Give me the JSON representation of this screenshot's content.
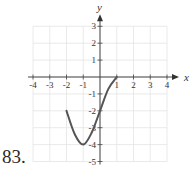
{
  "problem": {
    "number_label": "83."
  },
  "chart_data": {
    "type": "line",
    "title": "",
    "xlabel": "x",
    "ylabel": "y",
    "xlim": [
      -4,
      4
    ],
    "ylim": [
      -5,
      3
    ],
    "grid": true,
    "x_ticks": [
      -4,
      -3,
      -2,
      -1,
      1,
      2,
      3,
      4
    ],
    "y_ticks": [
      3,
      2,
      1,
      -1,
      -2,
      -3,
      -4,
      -5
    ],
    "series": [
      {
        "name": "f(x)",
        "description": "Curve starting at (-2,-2), decreasing to a minimum at (-1,-4), increasing through (0,-2) and leveling off at endpoint (1,0)",
        "points": [
          [
            -2,
            -2
          ],
          [
            -1.5,
            -3.4
          ],
          [
            -1,
            -4
          ],
          [
            -0.5,
            -3.3
          ],
          [
            0,
            -2
          ],
          [
            0.5,
            -0.7
          ],
          [
            1,
            0
          ]
        ],
        "color": "#555555"
      }
    ]
  }
}
